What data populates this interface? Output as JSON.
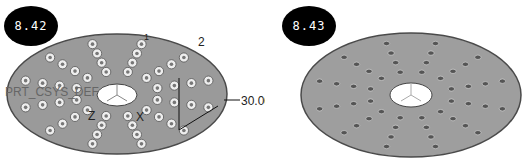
{
  "figures": [
    {
      "label": "8.42",
      "annotations": {
        "csys": "PRT_CSYS_DEF",
        "axis_z": "Z",
        "axis_x": "X",
        "axis_y": "Y",
        "dim_count": "2",
        "dim_angle": "30.00",
        "marker_1": "1"
      },
      "hole_style": "bosses",
      "rows": 12,
      "holes_per_row": 4
    },
    {
      "label": "8.43",
      "hole_style": "holes",
      "rows": 12,
      "holes_per_row": 4
    }
  ],
  "colors": {
    "disk_fill": "#9a9a9a",
    "disk_edge": "#4a4a4a",
    "badge_bg": "#000000",
    "badge_text": "#ffffff"
  }
}
